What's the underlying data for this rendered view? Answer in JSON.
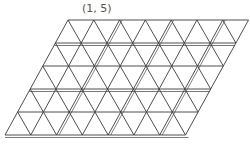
{
  "figure": {
    "label": "(1, 5)",
    "type": "parallelogram triangular lattice",
    "rows": 5,
    "columns": 7,
    "line_color": "#3a3a3a",
    "background": "#ffffff"
  }
}
